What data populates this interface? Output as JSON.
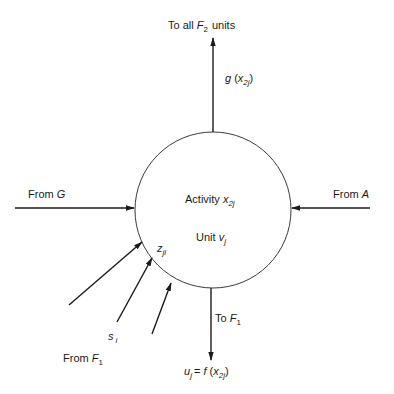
{
  "diagram": {
    "type": "neural-unit-schematic",
    "unit": {
      "activity_label": "Activity",
      "activity_var": "x",
      "activity_sub": "2j",
      "unit_label": "Unit",
      "unit_var": "v",
      "unit_sub": "j",
      "weight_var": "z",
      "weight_sub": "ji"
    },
    "top_output": {
      "label_prefix": "To all",
      "label_var": "F",
      "label_sub": "2",
      "label_suffix": "units",
      "signal_fn": "g",
      "signal_var": "x",
      "signal_sub": "2j"
    },
    "left_input": {
      "label_prefix": "From",
      "label_var": "G"
    },
    "right_input": {
      "label_prefix": "From",
      "label_var": "A"
    },
    "bottom_output": {
      "label_prefix": "To",
      "label_var": "F",
      "label_sub": "1",
      "eq_lhs_var": "u",
      "eq_lhs_sub": "j",
      "eq_op": "=",
      "eq_fn": "f",
      "eq_var": "x",
      "eq_sub": "2j"
    },
    "lower_left_inputs": {
      "signal_var": "s",
      "signal_sub": "i",
      "label_prefix": "From",
      "label_var": "F",
      "label_sub": "1",
      "count": 3
    },
    "stroke_color": "#1a1a1a"
  }
}
